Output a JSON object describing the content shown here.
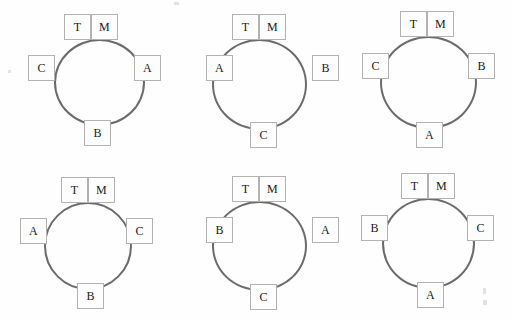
{
  "figure": {
    "type": "diagram-grid",
    "columns": 3,
    "rows": 2,
    "background_color": "#fefefe",
    "circle_stroke_color": "#6b6b6b",
    "box_border_color": "#b2b2b2",
    "text_color": "#1a1a1a"
  },
  "panels": [
    {
      "id": "panel-1",
      "top_left": "T",
      "top_right": "M",
      "left": "C",
      "right": "A",
      "bottom": "B"
    },
    {
      "id": "panel-2",
      "top_left": "T",
      "top_right": "M",
      "left": "A",
      "right": "B",
      "bottom": "C"
    },
    {
      "id": "panel-3",
      "top_left": "T",
      "top_right": "M",
      "left": "C",
      "right": "B",
      "bottom": "A"
    },
    {
      "id": "panel-4",
      "top_left": "T",
      "top_right": "M",
      "left": "A",
      "right": "C",
      "bottom": "B"
    },
    {
      "id": "panel-5",
      "top_left": "T",
      "top_right": "M",
      "left": "B",
      "right": "A",
      "bottom": "C"
    },
    {
      "id": "panel-6",
      "top_left": "T",
      "top_right": "M",
      "left": "B",
      "right": "C",
      "bottom": "A"
    }
  ]
}
